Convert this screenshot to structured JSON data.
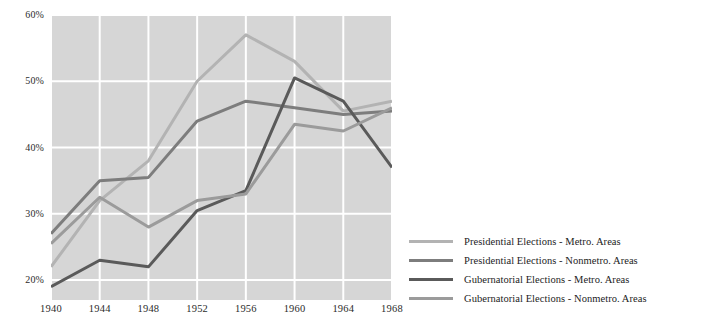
{
  "chart_data": {
    "type": "line",
    "title": "",
    "subtitle": "",
    "xlabel": "",
    "ylabel": "",
    "x": [
      1940,
      1944,
      1948,
      1952,
      1956,
      1960,
      1964,
      1968
    ],
    "categories": [
      "1940",
      "1944",
      "1948",
      "1952",
      "1956",
      "1960",
      "1964",
      "1968"
    ],
    "xtick_labels": [
      "1940",
      "1944",
      "1948",
      "1952",
      "1956",
      "1960",
      "1964",
      "1968"
    ],
    "ytick_labels": [
      "20%",
      "30%",
      "40%",
      "50%",
      "60%"
    ],
    "ytick_values": [
      20,
      30,
      40,
      50,
      60
    ],
    "ylim": [
      17.0,
      60.0
    ],
    "xlim": [
      1940,
      1968
    ],
    "grid": true,
    "grid_color": "#ffffff",
    "plot_background": "#d6d6d6",
    "figure_background": "#ffffff",
    "legend_position": "right",
    "value_unit": "%",
    "series": [
      {
        "name": "Presidential Elections - Metro. Areas",
        "color": "#b3b3b3",
        "values": [
          22.0,
          32.0,
          38.0,
          50.0,
          57.0,
          53.0,
          45.5,
          47.0
        ]
      },
      {
        "name": "Presidential Elections - Nonmetro. Areas",
        "color": "#7d7d7d",
        "values": [
          27.0,
          35.0,
          35.5,
          44.0,
          47.0,
          46.0,
          45.0,
          45.5
        ]
      },
      {
        "name": "Gubernatorial Elections - Metro. Areas",
        "color": "#5a5a5a",
        "values": [
          19.0,
          23.0,
          22.0,
          30.5,
          33.5,
          50.5,
          47.0,
          37.0
        ]
      },
      {
        "name": "Gubernatorial Elections - Nonmetro. Areas",
        "color": "#9b9b9b",
        "values": [
          25.5,
          32.5,
          28.0,
          32.0,
          33.0,
          43.5,
          42.5,
          46.0
        ]
      }
    ]
  },
  "legend": {
    "items": [
      {
        "label": "Presidential Elections - Metro. Areas",
        "color": "#b3b3b3"
      },
      {
        "label": "Presidential Elections - Nonmetro. Areas",
        "color": "#7d7d7d"
      },
      {
        "label": "Gubernatorial Elections - Metro. Areas",
        "color": "#5a5a5a"
      },
      {
        "label": "Gubernatorial Elections - Nonmetro. Areas",
        "color": "#9b9b9b"
      }
    ]
  }
}
